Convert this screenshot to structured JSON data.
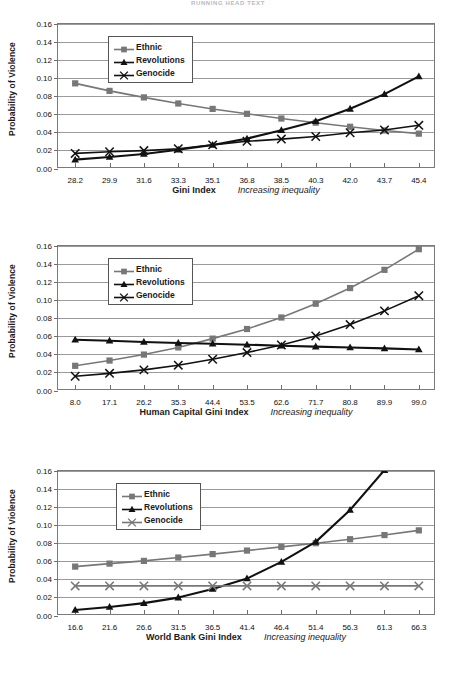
{
  "page_header": "RUNNING HEAD TEXT",
  "common": {
    "ylabel": "Probability of Violence",
    "increasing_caption": "Increasing inequality",
    "legend": [
      {
        "label": "Ethnic",
        "marker": "square",
        "color": "#777777"
      },
      {
        "label": "Revolutions",
        "marker": "triangle",
        "color": "#111111"
      },
      {
        "label": "Genocide",
        "marker": "cross",
        "color": "#111111"
      }
    ],
    "yticks": [
      "0.00",
      "0.02",
      "0.04",
      "0.06",
      "0.08",
      "0.10",
      "0.12",
      "0.14",
      "0.16"
    ]
  },
  "chart_data": [
    {
      "id": "gini-index-chart",
      "type": "line",
      "title": "",
      "xlabel": "Gini Index",
      "xlabel_note": "Increasing inequality",
      "ylabel": "Probability of Violence",
      "ylim": [
        0,
        0.16
      ],
      "grid": true,
      "legend_position": "top-left",
      "categories": [
        "28.2",
        "29.9",
        "31.6",
        "33.3",
        "35.1",
        "36.8",
        "38.5",
        "40.3",
        "42.0",
        "43.7",
        "45.4"
      ],
      "series": [
        {
          "name": "Ethnic",
          "color": "#777777",
          "marker": "square",
          "values": [
            0.0945,
            0.0862,
            0.079,
            0.0723,
            0.0663,
            0.0609,
            0.0557,
            0.0511,
            0.0466,
            0.0425,
            0.039
          ]
        },
        {
          "name": "Revolutions",
          "color": "#111111",
          "marker": "triangle",
          "values": [
            0.0103,
            0.0132,
            0.0165,
            0.0212,
            0.0265,
            0.0335,
            0.0428,
            0.0528,
            0.0664,
            0.0826,
            0.1022
          ]
        },
        {
          "name": "Genocide",
          "color": "#111111",
          "marker": "cross",
          "values": [
            0.0172,
            0.019,
            0.0203,
            0.0224,
            0.0266,
            0.0306,
            0.033,
            0.0359,
            0.04,
            0.043,
            0.0482
          ]
        }
      ]
    },
    {
      "id": "human-capital-gini-index-chart",
      "type": "line",
      "title": "",
      "xlabel": "Human Capital Gini  Index",
      "xlabel_note": "Increasing inequality",
      "ylabel": "Probability of Violence",
      "ylim": [
        0,
        0.16
      ],
      "grid": true,
      "legend_position": "top-left",
      "categories": [
        "8.0",
        "17.1",
        "26.2",
        "35.3",
        "44.4",
        "53.5",
        "62.6",
        "71.7",
        "80.8",
        "89.9",
        "99.0"
      ],
      "series": [
        {
          "name": "Ethnic",
          "color": "#777777",
          "marker": "square",
          "values": [
            0.0278,
            0.0336,
            0.0402,
            0.0481,
            0.0578,
            0.0684,
            0.0811,
            0.0963,
            0.1136,
            0.1337,
            0.1565
          ]
        },
        {
          "name": "Revolutions",
          "color": "#111111",
          "marker": "triangle",
          "values": [
            0.0566,
            0.0554,
            0.054,
            0.053,
            0.0521,
            0.0511,
            0.05,
            0.049,
            0.048,
            0.047,
            0.0458
          ]
        },
        {
          "name": "Genocide",
          "color": "#111111",
          "marker": "cross",
          "values": [
            0.0163,
            0.0195,
            0.0233,
            0.0285,
            0.035,
            0.0424,
            0.0508,
            0.0608,
            0.0733,
            0.0884,
            0.1052
          ]
        }
      ]
    },
    {
      "id": "world-bank-gini-index-chart",
      "type": "line",
      "title": "",
      "xlabel": "World Bank Gini Index",
      "xlabel_note": "Increasing inequality",
      "ylabel": "Probability of Violence",
      "ylim": [
        0,
        0.16
      ],
      "grid": true,
      "legend_position": "top-left",
      "categories": [
        "16.6",
        "21.6",
        "26.6",
        "31.5",
        "36.5",
        "41.4",
        "46.4",
        "51.4",
        "56.3",
        "61.3",
        "66.3"
      ],
      "series": [
        {
          "name": "Ethnic",
          "color": "#777777",
          "marker": "square",
          "values": [
            0.0545,
            0.0578,
            0.0608,
            0.0645,
            0.0683,
            0.0722,
            0.0763,
            0.0803,
            0.0847,
            0.0893,
            0.0945
          ]
        },
        {
          "name": "Revolutions",
          "color": "#111111",
          "marker": "triangle",
          "values": [
            0.0066,
            0.0099,
            0.0142,
            0.0203,
            0.0298,
            0.0413,
            0.0597,
            0.0818,
            0.117,
            0.161,
            0.21
          ]
        },
        {
          "name": "Genocide",
          "color": "#777777",
          "marker": "cross",
          "values": [
            0.0332,
            0.0332,
            0.0332,
            0.0332,
            0.0332,
            0.0332,
            0.0332,
            0.0332,
            0.0332,
            0.0332,
            0.0332
          ]
        }
      ]
    }
  ]
}
